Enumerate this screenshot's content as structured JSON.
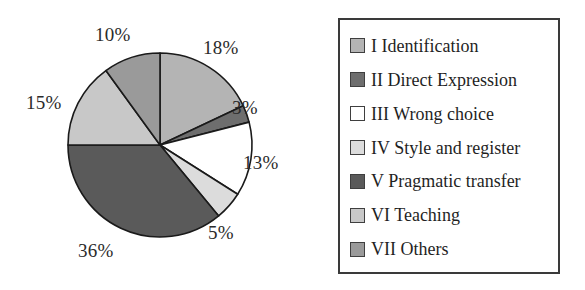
{
  "chart_data": {
    "type": "pie",
    "title": "",
    "subtitle": "",
    "xlabel": "",
    "ylabel": "",
    "grid": false,
    "legend_position": "right",
    "start_angle_deg": 0,
    "direction": "clockwise",
    "categories": [
      "I Identification",
      "II Direct Expression",
      "III Wrong choice",
      "IV Style and register",
      "V Pragmatic transfer",
      "VI Teaching",
      "VII Others"
    ],
    "values": [
      18,
      3,
      13,
      5,
      36,
      15,
      10
    ],
    "value_labels": [
      "18%",
      "3%",
      "13%",
      "5%",
      "36%",
      "15%",
      "10%"
    ],
    "colors": [
      "#b4b4b4",
      "#6e6e6e",
      "#ffffff",
      "#dcdcdc",
      "#5a5a5a",
      "#c8c8c8",
      "#9a9a9a"
    ],
    "slices": [
      {
        "label": "I Identification",
        "value": 18,
        "value_label": "18%",
        "color": "#b4b4b4"
      },
      {
        "label": "II Direct Expression",
        "value": 3,
        "value_label": "3%",
        "color": "#6e6e6e"
      },
      {
        "label": "III Wrong choice",
        "value": 13,
        "value_label": "13%",
        "color": "#ffffff"
      },
      {
        "label": "IV Style and register",
        "value": 5,
        "value_label": "5%",
        "color": "#dcdcdc"
      },
      {
        "label": "V Pragmatic transfer",
        "value": 36,
        "value_label": "36%",
        "color": "#5a5a5a"
      },
      {
        "label": "VI Teaching",
        "value": 15,
        "value_label": "15%",
        "color": "#c8c8c8"
      },
      {
        "label": "VII Others",
        "value": 10,
        "value_label": "9a9a9a"
      }
    ]
  },
  "pie": {
    "center_x": 160,
    "center_y": 145,
    "radius": 92,
    "stroke": "#1a1a1a",
    "labels": [
      {
        "text": "18%",
        "x": 203,
        "y": 37
      },
      {
        "text": "3%",
        "x": 232,
        "y": 97
      },
      {
        "text": "13%",
        "x": 243,
        "y": 152
      },
      {
        "text": "5%",
        "x": 208,
        "y": 222
      },
      {
        "text": "36%",
        "x": 78,
        "y": 240
      },
      {
        "text": "15%",
        "x": 26,
        "y": 92
      },
      {
        "text": "10%",
        "x": 95,
        "y": 24
      }
    ]
  },
  "legend": {
    "border_color": "#3a3a3a",
    "items": [
      {
        "label": "I Identification",
        "color": "#b4b4b4"
      },
      {
        "label": "II Direct Expression",
        "color": "#6e6e6e"
      },
      {
        "label": "III Wrong choice",
        "color": "#ffffff"
      },
      {
        "label": "IV Style and register",
        "color": "#dcdcdc"
      },
      {
        "label": "V Pragmatic transfer",
        "color": "#5a5a5a"
      },
      {
        "label": "VI Teaching",
        "color": "#c8c8c8"
      },
      {
        "label": "VII Others",
        "color": "#9a9a9a"
      }
    ]
  }
}
